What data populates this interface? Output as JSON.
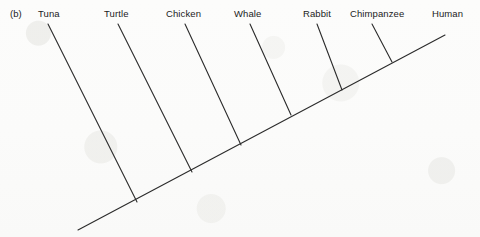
{
  "figure": {
    "panel_letter": "(b)",
    "background_color": "#fdfdfc",
    "line_color": "#2b2b2b"
  },
  "chart_data": {
    "type": "diagram",
    "diagram_kind": "cladogram",
    "title": "",
    "xlabel": "",
    "ylabel": "",
    "grid": false,
    "legend": null,
    "backbone": {
      "start": [
        78,
        230
      ],
      "end": [
        445,
        35
      ]
    },
    "taxa": [
      {
        "name": "Tuna",
        "order": 1,
        "label_x": 38,
        "label_y": 8,
        "branch_top": [
          48,
          24
        ],
        "branch_base": [
          137,
          202
        ]
      },
      {
        "name": "Turtle",
        "order": 2,
        "label_x": 104,
        "label_y": 8,
        "branch_top": [
          118,
          24
        ],
        "branch_base": [
          192,
          172
        ]
      },
      {
        "name": "Chicken",
        "order": 3,
        "label_x": 166,
        "label_y": 8,
        "branch_top": [
          185,
          24
        ],
        "branch_base": [
          241,
          145
        ]
      },
      {
        "name": "Whale",
        "order": 4,
        "label_x": 234,
        "label_y": 8,
        "branch_top": [
          250,
          24
        ],
        "branch_base": [
          291,
          115
        ]
      },
      {
        "name": "Rabbit",
        "order": 5,
        "label_x": 303,
        "label_y": 8,
        "branch_top": [
          317,
          24
        ],
        "branch_base": [
          342,
          90
        ]
      },
      {
        "name": "Chimpanzee",
        "order": 6,
        "label_x": 350,
        "label_y": 8,
        "branch_top": [
          372,
          24
        ],
        "branch_base": [
          392,
          62
        ]
      },
      {
        "name": "Human",
        "order": 7,
        "label_x": 432,
        "label_y": 8,
        "branch_top": [
          445,
          35
        ],
        "branch_base": [
          445,
          35
        ]
      }
    ]
  }
}
